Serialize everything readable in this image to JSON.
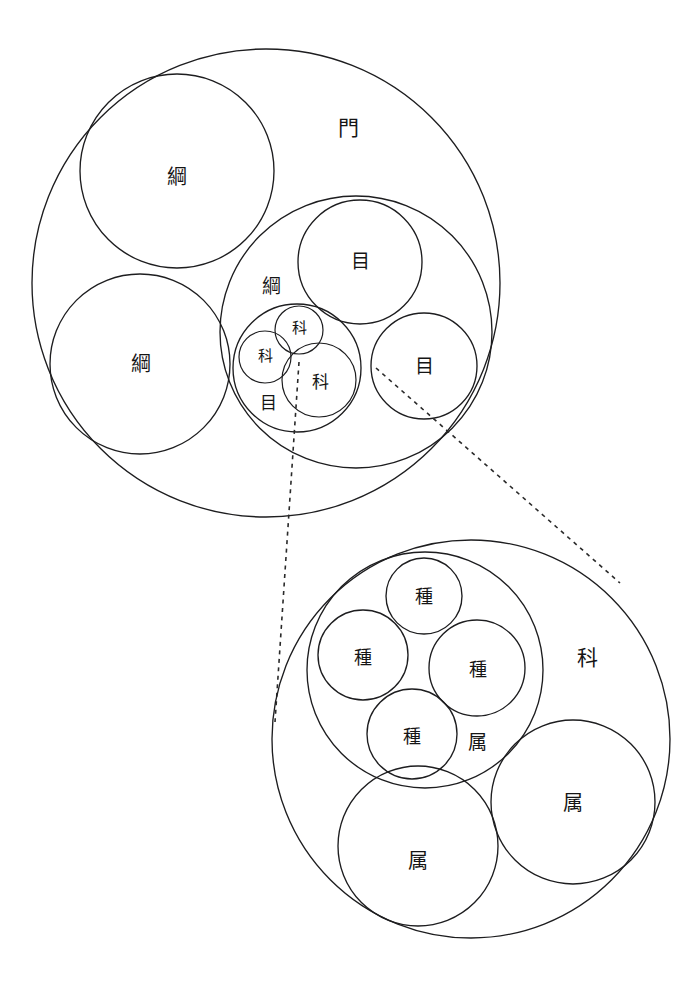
{
  "diagram": {
    "background_color": "#ffffff",
    "stroke_color": "#1d1d1f",
    "text_color": "#151515",
    "canvas": {
      "width": 699,
      "height": 983
    },
    "labels": {
      "phylum": "門",
      "class": "綱",
      "order": "目",
      "family": "科",
      "genus": "属",
      "species": "種"
    },
    "upper_group": {
      "name": "phylum-group",
      "root": {
        "id": "phylum-root",
        "rank": "phylum",
        "label": "門",
        "cx": 266,
        "cy": 283,
        "r": 234,
        "label_x": 348,
        "label_y": 128,
        "font_size": 21
      },
      "children": [
        {
          "id": "class-top-left",
          "rank": "class",
          "label": "綱",
          "cx": 177,
          "cy": 171,
          "r": 97,
          "label_x": 177,
          "label_y": 177,
          "font_size": 20
        },
        {
          "id": "class-bottom-left",
          "rank": "class",
          "label": "綱",
          "cx": 140,
          "cy": 364,
          "r": 90,
          "label_x": 141,
          "label_y": 364,
          "font_size": 20
        },
        {
          "id": "class-right",
          "rank": "class",
          "label": "綱",
          "cx": 356,
          "cy": 332,
          "r": 136,
          "label_x": 271,
          "label_y": 286,
          "font_size": 19
        }
      ],
      "orders": [
        {
          "id": "order-top",
          "rank": "order",
          "label": "目",
          "cx": 360,
          "cy": 262,
          "r": 62,
          "label_x": 360,
          "label_y": 261,
          "font_size": 19
        },
        {
          "id": "order-right",
          "rank": "order",
          "label": "目",
          "cx": 424,
          "cy": 366,
          "r": 53,
          "label_x": 424,
          "label_y": 366,
          "font_size": 19
        },
        {
          "id": "order-detail",
          "rank": "order",
          "label": "目",
          "cx": 297,
          "cy": 368,
          "r": 64,
          "label_x": 268,
          "label_y": 403,
          "font_size": 17
        }
      ],
      "families": [
        {
          "id": "family-upper-small",
          "rank": "family",
          "label": "科",
          "cx": 299,
          "cy": 330,
          "r": 24,
          "label_x": 299,
          "label_y": 328,
          "font_size": 15
        },
        {
          "id": "family-left-small",
          "rank": "family",
          "label": "科",
          "cx": 265,
          "cy": 357,
          "r": 26,
          "label_x": 265,
          "label_y": 356,
          "font_size": 15
        },
        {
          "id": "family-zoomed",
          "rank": "family",
          "label": "科",
          "cx": 319,
          "cy": 380,
          "r": 37,
          "label_x": 320,
          "label_y": 382,
          "font_size": 17
        }
      ]
    },
    "lower_group": {
      "name": "family-detail-group",
      "root": {
        "id": "family-root",
        "rank": "family",
        "label": "科",
        "cx": 471,
        "cy": 739,
        "r": 199,
        "label_x": 587,
        "label_y": 658,
        "font_size": 21
      },
      "genera": [
        {
          "id": "genus-detail",
          "rank": "genus",
          "label": "属",
          "cx": 425,
          "cy": 670,
          "r": 118,
          "label_x": 477,
          "label_y": 742,
          "font_size": 19
        },
        {
          "id": "genus-bottom-left",
          "rank": "genus",
          "label": "属",
          "cx": 418,
          "cy": 846,
          "r": 80,
          "label_x": 418,
          "label_y": 861,
          "font_size": 20
        },
        {
          "id": "genus-right",
          "rank": "genus",
          "label": "属",
          "cx": 573,
          "cy": 802,
          "r": 82,
          "label_x": 573,
          "label_y": 803,
          "font_size": 20
        }
      ],
      "species": [
        {
          "id": "species-top",
          "rank": "species",
          "label": "種",
          "cx": 424,
          "cy": 596,
          "r": 38,
          "label_x": 424,
          "label_y": 596,
          "font_size": 18
        },
        {
          "id": "species-left",
          "rank": "species",
          "label": "種",
          "cx": 363,
          "cy": 655,
          "r": 45,
          "label_x": 363,
          "label_y": 657,
          "font_size": 18
        },
        {
          "id": "species-right",
          "rank": "species",
          "label": "種",
          "cx": 477,
          "cy": 668,
          "r": 48,
          "label_x": 478,
          "label_y": 669,
          "font_size": 18
        },
        {
          "id": "species-bottom",
          "rank": "species",
          "label": "種",
          "cx": 412,
          "cy": 734,
          "r": 45,
          "label_x": 412,
          "label_y": 736,
          "font_size": 18
        }
      ]
    },
    "leader_lines": [
      {
        "id": "leader-left",
        "from_x": 299,
        "from_y": 362,
        "to_x": 275,
        "to_y": 722
      },
      {
        "id": "leader-right",
        "from_x": 376,
        "from_y": 368,
        "to_x": 620,
        "to_y": 583
      }
    ]
  }
}
